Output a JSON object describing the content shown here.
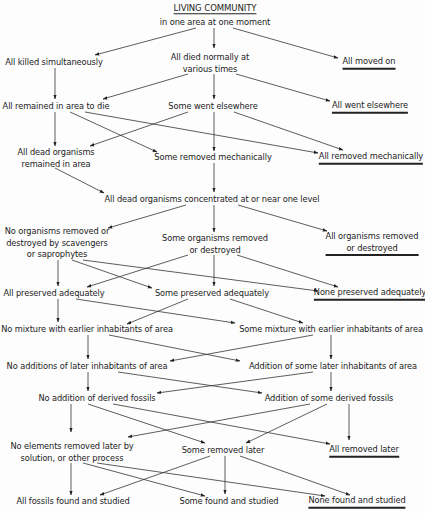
{
  "diagram": {
    "title": "LIVING COMMUNITY",
    "subtitle": "in one area at one moment",
    "nodes": [
      {
        "id": "killed",
        "lines": [
          "All killed simultaneously"
        ],
        "x": 54,
        "y": 62,
        "terminal": false
      },
      {
        "id": "died",
        "lines": [
          "All died normally at",
          "various times"
        ],
        "x": 210,
        "y": 62,
        "terminal": false
      },
      {
        "id": "moved",
        "lines": [
          "All moved on"
        ],
        "x": 369,
        "y": 62,
        "terminal": true
      },
      {
        "id": "remained",
        "lines": [
          "All remained in area to die"
        ],
        "x": 56,
        "y": 106,
        "terminal": false
      },
      {
        "id": "somewent",
        "lines": [
          "Some went elsewhere"
        ],
        "x": 213,
        "y": 106,
        "terminal": false
      },
      {
        "id": "allwent",
        "lines": [
          "All went elsewhere"
        ],
        "x": 370,
        "y": 106,
        "terminal": true
      },
      {
        "id": "deadremained",
        "lines": [
          "All dead organisms",
          "remained in area"
        ],
        "x": 56,
        "y": 157,
        "terminal": false
      },
      {
        "id": "someremmech",
        "lines": [
          "Some removed mechanically"
        ],
        "x": 213,
        "y": 157,
        "terminal": false
      },
      {
        "id": "allremmech",
        "lines": [
          "All removed mechanically"
        ],
        "x": 371,
        "y": 157,
        "terminal": true
      },
      {
        "id": "concentrated",
        "lines": [
          "All dead organisms concentrated at or near one level"
        ],
        "x": 212,
        "y": 199,
        "terminal": false
      },
      {
        "id": "noorgrem",
        "lines": [
          "No organisms removed or",
          "destroyed by scavengers",
          "or saprophytes"
        ],
        "x": 57,
        "y": 242,
        "terminal": false
      },
      {
        "id": "someorgrem",
        "lines": [
          "Some organisms removed",
          "or destroyed"
        ],
        "x": 215,
        "y": 243,
        "terminal": false
      },
      {
        "id": "allorgrem",
        "lines": [
          "All organisms removed",
          "or destroyed"
        ],
        "x": 372,
        "y": 243,
        "terminal": true
      },
      {
        "id": "allpres",
        "lines": [
          "All preserved adequately"
        ],
        "x": 54,
        "y": 293,
        "terminal": false
      },
      {
        "id": "somepres",
        "lines": [
          "Some preserved adequately"
        ],
        "x": 212,
        "y": 293,
        "terminal": false
      },
      {
        "id": "nonepres",
        "lines": [
          "None preserved adequately"
        ],
        "x": 370,
        "y": 293,
        "terminal": true
      },
      {
        "id": "nomix",
        "lines": [
          "No mixture with earlier inhabitants of area"
        ],
        "x": 87,
        "y": 329,
        "terminal": false
      },
      {
        "id": "somemix",
        "lines": [
          "Some mixture with earlier inhabitants of area"
        ],
        "x": 331,
        "y": 329,
        "terminal": false
      },
      {
        "id": "noadd",
        "lines": [
          "No additions of later inhabitants of area"
        ],
        "x": 87,
        "y": 366,
        "terminal": false
      },
      {
        "id": "someadd",
        "lines": [
          "Addition of some later inhabitants of area"
        ],
        "x": 333,
        "y": 366,
        "terminal": false
      },
      {
        "id": "noderived",
        "lines": [
          "No addition of derived fossils"
        ],
        "x": 97,
        "y": 398,
        "terminal": false
      },
      {
        "id": "somederived",
        "lines": [
          "Addition of some derived fossils"
        ],
        "x": 329,
        "y": 398,
        "terminal": false
      },
      {
        "id": "noelements",
        "lines": [
          "No elements removed later by",
          "solution, or other process"
        ],
        "x": 72,
        "y": 451,
        "terminal": false
      },
      {
        "id": "someremlater",
        "lines": [
          "Some removed later"
        ],
        "x": 223,
        "y": 450,
        "terminal": false
      },
      {
        "id": "allremlater",
        "lines": [
          "All removed later"
        ],
        "x": 364,
        "y": 450,
        "terminal": true
      },
      {
        "id": "allfound",
        "lines": [
          "All fossils found and studied"
        ],
        "x": 73,
        "y": 501,
        "terminal": false
      },
      {
        "id": "somefound",
        "lines": [
          "Some found and studied"
        ],
        "x": 229,
        "y": 501,
        "terminal": false
      },
      {
        "id": "nonefound",
        "lines": [
          "None found and studied"
        ],
        "x": 357,
        "y": 501,
        "terminal": true
      }
    ],
    "arrows": [
      {
        "from": [
          196,
          28
        ],
        "to": [
          95,
          55
        ]
      },
      {
        "from": [
          214,
          28
        ],
        "to": [
          214,
          48
        ]
      },
      {
        "from": [
          233,
          28
        ],
        "to": [
          338,
          58
        ]
      },
      {
        "from": [
          55,
          68
        ],
        "to": [
          55,
          99
        ]
      },
      {
        "from": [
          188,
          74
        ],
        "to": [
          103,
          99
        ]
      },
      {
        "from": [
          214,
          74
        ],
        "to": [
          214,
          99
        ]
      },
      {
        "from": [
          236,
          74
        ],
        "to": [
          330,
          101
        ]
      },
      {
        "from": [
          55,
          112
        ],
        "to": [
          55,
          146
        ]
      },
      {
        "from": [
          70,
          112
        ],
        "to": [
          157,
          152
        ]
      },
      {
        "from": [
          85,
          112
        ],
        "to": [
          318,
          153
        ]
      },
      {
        "from": [
          188,
          112
        ],
        "to": [
          90,
          146
        ]
      },
      {
        "from": [
          214,
          112
        ],
        "to": [
          214,
          151
        ]
      },
      {
        "from": [
          234,
          112
        ],
        "to": [
          343,
          150
        ]
      },
      {
        "from": [
          55,
          168
        ],
        "to": [
          104,
          193
        ]
      },
      {
        "from": [
          214,
          163
        ],
        "to": [
          214,
          192
        ]
      },
      {
        "from": [
          186,
          205
        ],
        "to": [
          108,
          228
        ]
      },
      {
        "from": [
          214,
          205
        ],
        "to": [
          214,
          232
        ]
      },
      {
        "from": [
          238,
          205
        ],
        "to": [
          327,
          231
        ]
      },
      {
        "from": [
          58,
          260
        ],
        "to": [
          58,
          286
        ]
      },
      {
        "from": [
          72,
          260
        ],
        "to": [
          152,
          288
        ]
      },
      {
        "from": [
          83,
          260
        ],
        "to": [
          318,
          291
        ]
      },
      {
        "from": [
          188,
          255
        ],
        "to": [
          87,
          287
        ]
      },
      {
        "from": [
          214,
          255
        ],
        "to": [
          214,
          286
        ]
      },
      {
        "from": [
          237,
          255
        ],
        "to": [
          338,
          287
        ]
      },
      {
        "from": [
          58,
          299
        ],
        "to": [
          58,
          322
        ]
      },
      {
        "from": [
          76,
          299
        ],
        "to": [
          235,
          323
        ]
      },
      {
        "from": [
          188,
          299
        ],
        "to": [
          127,
          324
        ]
      },
      {
        "from": [
          230,
          299
        ],
        "to": [
          303,
          323
        ]
      },
      {
        "from": [
          88,
          335
        ],
        "to": [
          88,
          359
        ]
      },
      {
        "from": [
          109,
          335
        ],
        "to": [
          240,
          361
        ]
      },
      {
        "from": [
          313,
          335
        ],
        "to": [
          170,
          361
        ]
      },
      {
        "from": [
          331,
          335
        ],
        "to": [
          331,
          359
        ]
      },
      {
        "from": [
          88,
          372
        ],
        "to": [
          88,
          391
        ]
      },
      {
        "from": [
          118,
          372
        ],
        "to": [
          262,
          393
        ]
      },
      {
        "from": [
          313,
          372
        ],
        "to": [
          157,
          393
        ]
      },
      {
        "from": [
          331,
          372
        ],
        "to": [
          331,
          391
        ]
      },
      {
        "from": [
          71,
          404
        ],
        "to": [
          71,
          432
        ]
      },
      {
        "from": [
          88,
          404
        ],
        "to": [
          205,
          443
        ]
      },
      {
        "from": [
          113,
          404
        ],
        "to": [
          330,
          444
        ]
      },
      {
        "from": [
          310,
          404
        ],
        "to": [
          128,
          437
        ]
      },
      {
        "from": [
          327,
          404
        ],
        "to": [
          246,
          443
        ]
      },
      {
        "from": [
          349,
          404
        ],
        "to": [
          349,
          440
        ]
      },
      {
        "from": [
          71,
          463
        ],
        "to": [
          71,
          495
        ]
      },
      {
        "from": [
          83,
          463
        ],
        "to": [
          205,
          496
        ]
      },
      {
        "from": [
          97,
          463
        ],
        "to": [
          325,
          496
        ]
      },
      {
        "from": [
          210,
          456
        ],
        "to": [
          100,
          495
        ]
      },
      {
        "from": [
          225,
          456
        ],
        "to": [
          225,
          494
        ]
      },
      {
        "from": [
          240,
          456
        ],
        "to": [
          350,
          495
        ]
      }
    ]
  }
}
